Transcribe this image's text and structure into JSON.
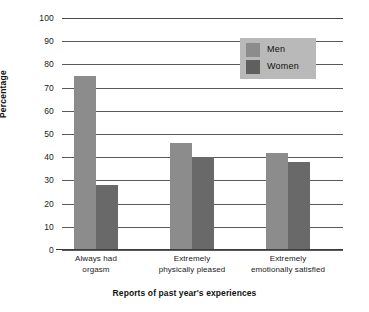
{
  "chart_data": {
    "type": "bar",
    "title": "",
    "xlabel": "Reports of past year's experiences",
    "ylabel": "Percentage",
    "categories": [
      "Always had orgasm",
      "Extremely physically pleased",
      "Extremely emotionally satisfied"
    ],
    "category_lines": [
      [
        "Always had",
        "orgasm"
      ],
      [
        "Extremely",
        "physically pleased"
      ],
      [
        "Extremely",
        "emotionally satisfied"
      ]
    ],
    "series": [
      {
        "name": "Men",
        "values": [
          75,
          46,
          42
        ],
        "color": "#8c8c8c"
      },
      {
        "name": "Women",
        "values": [
          28,
          40,
          38
        ],
        "color": "#696969"
      }
    ],
    "ylim": [
      0,
      100
    ],
    "ytick_step": 10,
    "yticks": [
      100,
      90,
      80,
      70,
      60,
      50,
      40,
      30,
      20,
      10,
      0
    ],
    "grid": true,
    "legend_position": "top-right",
    "legend_background": "#b9b9b9"
  },
  "legend": {
    "entries": [
      {
        "label": "Men"
      },
      {
        "label": "Women"
      }
    ]
  }
}
